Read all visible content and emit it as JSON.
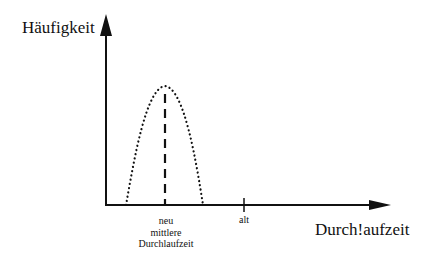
{
  "diagram": {
    "y_axis_label": "Häufigkeit",
    "x_axis_label": "Durch!aufzeit",
    "tick_new": {
      "line1": "neu",
      "line2": "mittlere",
      "line3": "Durchlaufzeit"
    },
    "tick_old": "alt",
    "curve": {
      "style": "dotted",
      "shape": "bell",
      "peak_x": 165,
      "peak_y": 86,
      "left_x": 126,
      "right_x": 203
    },
    "mean_line": {
      "style": "dashed",
      "x": 165
    },
    "colors": {
      "ink": "#111111",
      "background": "#ffffff"
    }
  }
}
